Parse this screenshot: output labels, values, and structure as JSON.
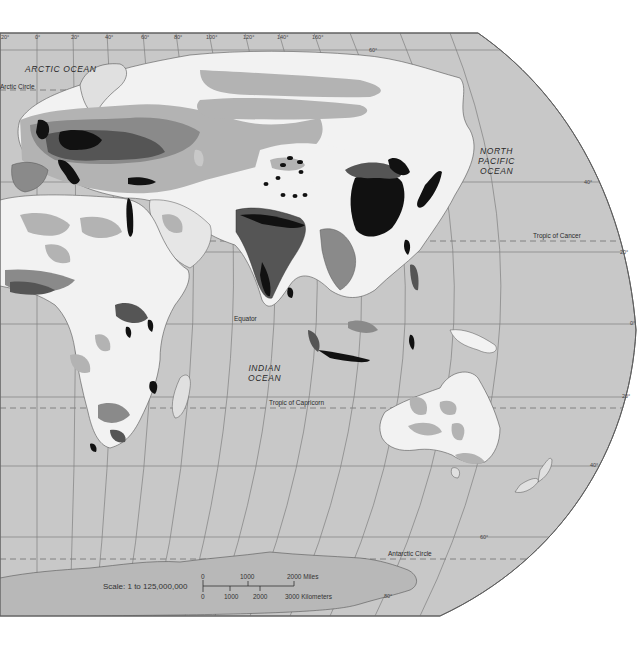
{
  "map": {
    "type": "population density world map (Eastern Hemisphere)",
    "colors": {
      "ocean": "#c8c8c8",
      "land_lowest": "#f2f2f2",
      "land_low": "#b3b3b3",
      "land_mid": "#8a8a8a",
      "land_high": "#555555",
      "land_highest": "#111111",
      "graticule": "#7a7a7a",
      "border": "#444444"
    },
    "ocean_labels": [
      {
        "id": "arctic",
        "text": "ARCTIC  OCEAN",
        "x": 25,
        "y": 64
      },
      {
        "id": "north-pacific",
        "text": "NORTH\nPACIFIC\nOCEAN",
        "x": 478,
        "y": 146
      },
      {
        "id": "indian",
        "text": "INDIAN\nOCEAN",
        "x": 248,
        "y": 363
      }
    ],
    "line_labels": [
      {
        "id": "arctic-circle",
        "text": "Arctic Circle",
        "x": 0,
        "y": 84
      },
      {
        "id": "tropic-of-cancer",
        "text": "Tropic of Cancer",
        "x": 533,
        "y": 233
      },
      {
        "id": "equator",
        "text": "Equator",
        "x": 234,
        "y": 318
      },
      {
        "id": "tropic-of-capricorn",
        "text": "Tropic of Capricorn",
        "x": 269,
        "y": 401
      },
      {
        "id": "antarctic-circle",
        "text": "Antarctic Circle",
        "x": 388,
        "y": 551
      }
    ],
    "meridian_labels": [
      {
        "text": "20°",
        "x": 1,
        "y": 36
      },
      {
        "text": "0°",
        "x": 35,
        "y": 36
      },
      {
        "text": "20°",
        "x": 71,
        "y": 36
      },
      {
        "text": "40°",
        "x": 105,
        "y": 36
      },
      {
        "text": "60°",
        "x": 141,
        "y": 36
      },
      {
        "text": "80°",
        "x": 174,
        "y": 36
      },
      {
        "text": "100°",
        "x": 206,
        "y": 36
      },
      {
        "text": "120°",
        "x": 243,
        "y": 36
      },
      {
        "text": "140°",
        "x": 277,
        "y": 36
      },
      {
        "text": "160°",
        "x": 312,
        "y": 36
      }
    ],
    "parallel_labels": [
      {
        "text": "60°",
        "x": 369,
        "y": 49
      },
      {
        "text": "40°",
        "x": 584,
        "y": 181
      },
      {
        "text": "20°",
        "x": 620,
        "y": 251
      },
      {
        "text": "0°",
        "x": 632,
        "y": 323
      },
      {
        "text": "20°",
        "x": 624,
        "y": 396
      },
      {
        "text": "40°",
        "x": 592,
        "y": 465
      },
      {
        "text": "60°",
        "x": 480,
        "y": 537
      },
      {
        "text": "80°",
        "x": 384,
        "y": 596
      }
    ],
    "scale": {
      "label": "Scale:  1 to 125,000,000",
      "miles_ticks": [
        "0",
        "1000",
        "2000 Miles"
      ],
      "km_ticks": [
        "0",
        "1000",
        "2000",
        "3000 Kilometers"
      ]
    }
  }
}
